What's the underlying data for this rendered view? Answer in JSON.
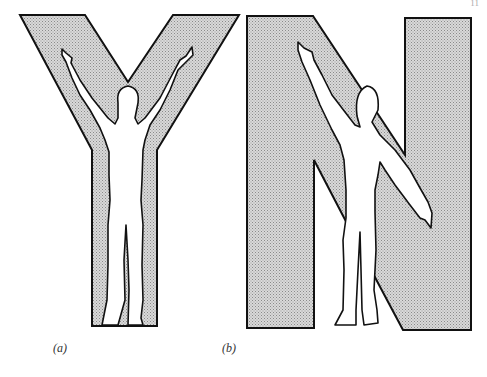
{
  "figure": {
    "panels": [
      {
        "id": "a",
        "label": "(a)",
        "letter": "Y",
        "description": "Human silhouette with both arms raised forming the letter Y"
      },
      {
        "id": "b",
        "label": "(b)",
        "letter": "N",
        "description": "Human silhouette with one arm raised and one lowered forming the letter N"
      }
    ],
    "corner_mark": "11"
  },
  "colors": {
    "fill": "#c8c8c8",
    "stroke": "#111111",
    "figure_fill": "#ffffff"
  }
}
